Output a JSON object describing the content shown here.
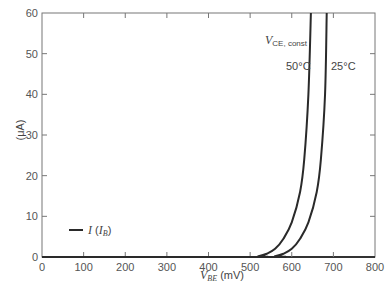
{
  "chart_data": {
    "type": "line",
    "title": "",
    "xlabel_main": "V",
    "xlabel_sub": "BE",
    "xlabel_unit": " (mV)",
    "ylabel": "(μA)",
    "xlim": [
      0,
      800
    ],
    "ylim": [
      0,
      60
    ],
    "xticks": [
      0,
      100,
      200,
      300,
      400,
      500,
      600,
      700,
      800
    ],
    "yticks": [
      0,
      10,
      20,
      30,
      40,
      50,
      60
    ],
    "grid": false,
    "legend": {
      "placement": "bottom-left",
      "label_main": "I",
      "label_paren_open": " (",
      "label_sym": "I",
      "label_sub": "B",
      "label_paren_close": ")"
    },
    "annotations": {
      "vce_main": "V",
      "vce_sub": "CE, const",
      "t50": "50°C",
      "t25": "25°C"
    },
    "series": [
      {
        "name": "50°C",
        "x": [
          0,
          500,
          520,
          540,
          560,
          580,
          600,
          620,
          630,
          640,
          646
        ],
        "y": [
          0,
          0,
          0.2,
          0.8,
          2,
          4.5,
          8.5,
          16,
          24,
          40,
          60
        ]
      },
      {
        "name": "25°C",
        "x": [
          0,
          540,
          560,
          580,
          600,
          620,
          640,
          660,
          670,
          680,
          684
        ],
        "y": [
          0,
          0,
          0.2,
          0.8,
          2,
          4.5,
          8.5,
          16,
          24,
          40,
          60
        ]
      }
    ]
  }
}
